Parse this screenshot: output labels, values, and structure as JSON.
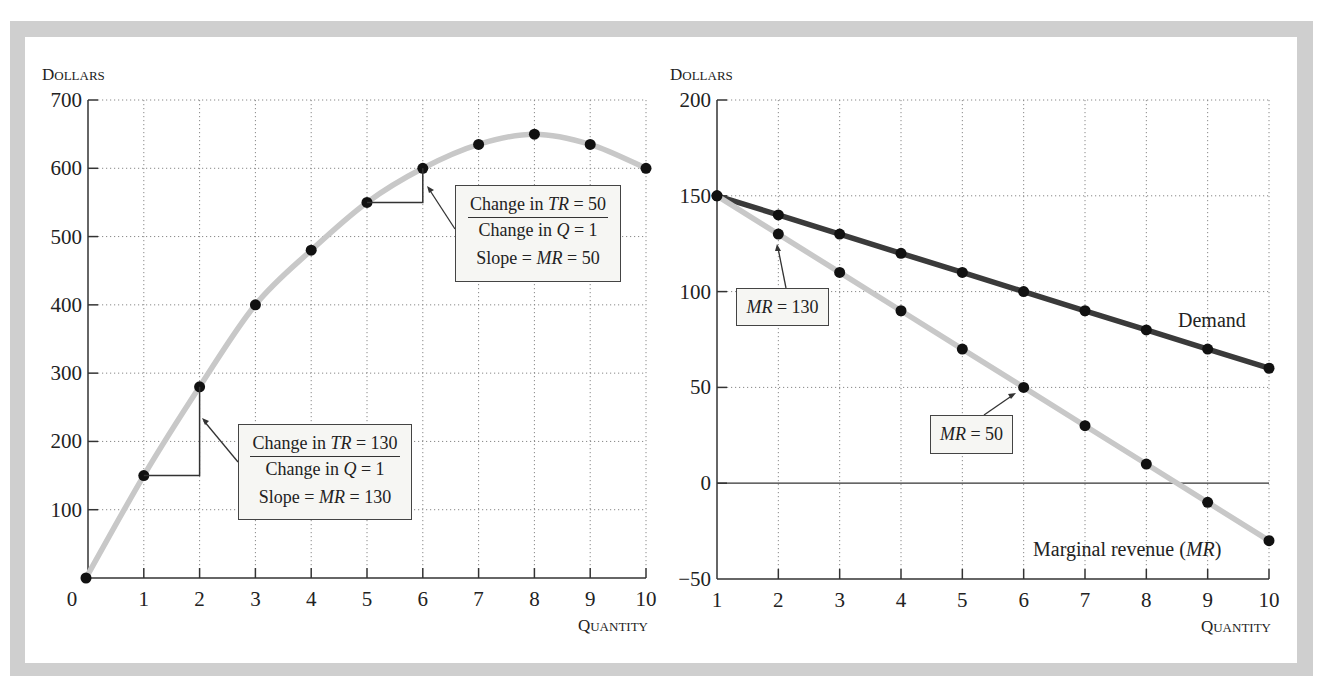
{
  "chart_data": [
    {
      "type": "line",
      "title": "",
      "ylabel": "Dollars",
      "xlabel": "Quantity",
      "xlim": [
        0,
        10
      ],
      "ylim": [
        0,
        700
      ],
      "x_ticks": [
        "0",
        "1",
        "2",
        "3",
        "4",
        "5",
        "6",
        "7",
        "8",
        "9",
        "10"
      ],
      "y_ticks": [
        "100",
        "200",
        "300",
        "400",
        "500",
        "600",
        "700"
      ],
      "grid": true,
      "series": [
        {
          "name": "Total revenue (TR)",
          "color": "#c8c8c8",
          "x": [
            0,
            1,
            2,
            3,
            4,
            5,
            6,
            7,
            8,
            9,
            10
          ],
          "values": [
            0,
            150,
            280,
            400,
            480,
            550,
            600,
            635,
            650,
            635,
            600
          ]
        }
      ],
      "annotations": [
        {
          "numerator": [
            "Change in ",
            "TR",
            " = 130"
          ],
          "denominator": [
            "Change in ",
            "Q",
            " = 1"
          ],
          "slope": [
            "Slope = ",
            "MR",
            " = 130"
          ]
        },
        {
          "numerator": [
            "Change in ",
            "TR",
            " = 50"
          ],
          "denominator": [
            "Change in ",
            "Q",
            " = 1"
          ],
          "slope": [
            "Slope = ",
            "MR",
            " = 50"
          ]
        }
      ]
    },
    {
      "type": "line",
      "title": "",
      "ylabel": "Dollars",
      "xlabel": "Quantity",
      "xlim": [
        1,
        10
      ],
      "ylim": [
        -50,
        200
      ],
      "x_ticks": [
        "1",
        "2",
        "3",
        "4",
        "5",
        "6",
        "7",
        "8",
        "9",
        "10"
      ],
      "y_ticks": [
        "−50",
        "0",
        "50",
        "100",
        "150",
        "200"
      ],
      "grid": true,
      "series": [
        {
          "name": "Demand",
          "color": "#3a3a3a",
          "x": [
            1,
            2,
            3,
            4,
            5,
            6,
            7,
            8,
            9,
            10
          ],
          "values": [
            150,
            140,
            130,
            120,
            110,
            100,
            90,
            80,
            70,
            60
          ]
        },
        {
          "name": "Marginal revenue (MR)",
          "color": "#c8c8c8",
          "x": [
            1,
            2,
            3,
            4,
            5,
            6,
            7,
            8,
            9,
            10
          ],
          "values": [
            150,
            130,
            110,
            90,
            70,
            50,
            30,
            10,
            -10,
            -30
          ]
        }
      ],
      "annotations": [
        {
          "label": [
            "MR",
            " = 130"
          ]
        },
        {
          "label": [
            "MR",
            " = 50"
          ]
        }
      ],
      "series_labels": {
        "demand": "Demand",
        "mr_prefix": "Marginal revenue (",
        "mr_italic": "MR",
        "mr_suffix": ")"
      }
    }
  ]
}
